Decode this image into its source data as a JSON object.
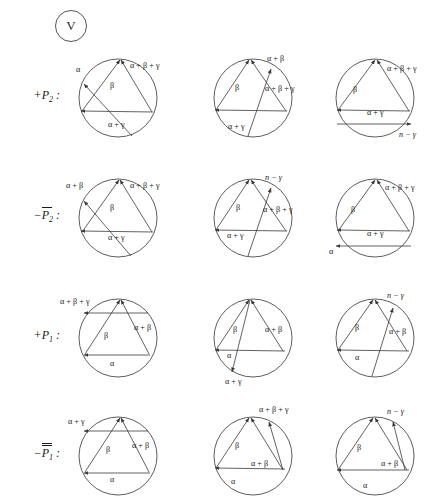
{
  "figure": {
    "badge_label": "V",
    "width": 431,
    "height": 497,
    "symbols": {
      "alpha": "α",
      "beta": "β",
      "gamma": "γ"
    }
  },
  "rows": [
    {
      "id": "plus-P2",
      "label_sign": "+",
      "label_var": "P",
      "label_sub": "2",
      "label_bars": 0,
      "label_colon": ":",
      "top": 48,
      "panels": [
        {
          "id": "r1c1",
          "labels": [
            {
              "text": "α",
              "x": 8,
              "y": 24
            },
            {
              "text": "α + β + γ",
              "x": 62,
              "y": 20
            },
            {
              "text": "β",
              "x": 42,
              "y": 40
            },
            {
              "text": "α + γ",
              "x": 40,
              "y": 79
            }
          ]
        },
        {
          "id": "r1c2",
          "labels": [
            {
              "text": "α + β",
              "x": 64,
              "y": 13
            },
            {
              "text": "α + β + γ",
              "x": 62,
              "y": 43
            },
            {
              "text": "β",
              "x": 32,
              "y": 42
            },
            {
              "text": "α + γ",
              "x": 25,
              "y": 81
            }
          ]
        },
        {
          "id": "r1c3",
          "labels": [
            {
              "text": "α + β + γ",
              "x": 62,
              "y": 23
            },
            {
              "text": "β",
              "x": 28,
              "y": 44
            },
            {
              "text": "α + γ",
              "x": 42,
              "y": 67
            },
            {
              "text": "n − γ",
              "x": 74,
              "y": 89
            }
          ]
        }
      ]
    },
    {
      "id": "minus-P2bar",
      "label_sign": "−",
      "label_var": "P",
      "label_sub": "2",
      "label_bars": 1,
      "label_colon": ":",
      "top": 168,
      "panels": [
        {
          "id": "r2c1",
          "labels": [
            {
              "text": "α + β",
              "x": -2,
              "y": 20
            },
            {
              "text": "α + β + γ",
              "x": 62,
              "y": 20
            },
            {
              "text": "β",
              "x": 42,
              "y": 42
            },
            {
              "text": "α + γ",
              "x": 40,
              "y": 72
            }
          ]
        },
        {
          "id": "r2c2",
          "labels": [
            {
              "text": "n − γ",
              "x": 62,
              "y": 12
            },
            {
              "text": "α + β + γ",
              "x": 60,
              "y": 44
            },
            {
              "text": "β",
              "x": 33,
              "y": 42
            },
            {
              "text": "α + γ",
              "x": 24,
              "y": 70
            }
          ]
        },
        {
          "id": "r2c3",
          "labels": [
            {
              "text": "α + β + γ",
              "x": 60,
              "y": 22
            },
            {
              "text": "β",
              "x": 26,
              "y": 44
            },
            {
              "text": "α + γ",
              "x": 42,
              "y": 68
            },
            {
              "text": "α",
              "x": 4,
              "y": 86
            }
          ]
        }
      ]
    },
    {
      "id": "plus-P1",
      "label_sign": "+",
      "label_var": "P",
      "label_sub": "1",
      "label_bars": 0,
      "label_colon": ":",
      "top": 288,
      "panels": [
        {
          "id": "r3c1",
          "labels": [
            {
              "text": "α + β + γ",
              "x": -8,
              "y": 16
            },
            {
              "text": "β",
              "x": 36,
              "y": 50
            },
            {
              "text": "α + β",
              "x": 66,
              "y": 42
            },
            {
              "text": "α",
              "x": 42,
              "y": 78
            }
          ]
        },
        {
          "id": "r3c2",
          "labels": [
            {
              "text": "β",
              "x": 30,
              "y": 44
            },
            {
              "text": "α + β",
              "x": 62,
              "y": 44
            },
            {
              "text": "α",
              "x": 24,
              "y": 70
            },
            {
              "text": "α + γ",
              "x": 22,
              "y": 96
            }
          ]
        },
        {
          "id": "r3c3",
          "labels": [
            {
              "text": "n − γ",
              "x": 62,
              "y": 10
            },
            {
              "text": "β",
              "x": 30,
              "y": 42
            },
            {
              "text": "α + β",
              "x": 64,
              "y": 46
            },
            {
              "text": "α",
              "x": 30,
              "y": 72
            }
          ]
        }
      ]
    },
    {
      "id": "minus-P1bar",
      "label_sign": "−",
      "label_var": "P",
      "label_sub": "1",
      "label_bars": 2,
      "label_colon": ":",
      "top": 408,
      "panels": [
        {
          "id": "r4c1",
          "labels": [
            {
              "text": "α + γ",
              "x": 0,
              "y": 16
            },
            {
              "text": "β",
              "x": 38,
              "y": 44
            },
            {
              "text": "α + β",
              "x": 64,
              "y": 40
            },
            {
              "text": "α",
              "x": 42,
              "y": 74
            }
          ]
        },
        {
          "id": "r4c2",
          "labels": [
            {
              "text": "α + β + γ",
              "x": 56,
              "y": 4
            },
            {
              "text": "β",
              "x": 32,
              "y": 40
            },
            {
              "text": "α + β",
              "x": 48,
              "y": 58
            },
            {
              "text": "α",
              "x": 28,
              "y": 76
            }
          ]
        },
        {
          "id": "r4c3",
          "labels": [
            {
              "text": "n − γ",
              "x": 62,
              "y": 6
            },
            {
              "text": "β",
              "x": 32,
              "y": 42
            },
            {
              "text": "α + β",
              "x": 56,
              "y": 58
            },
            {
              "text": "α",
              "x": 38,
              "y": 80
            }
          ]
        }
      ]
    }
  ]
}
